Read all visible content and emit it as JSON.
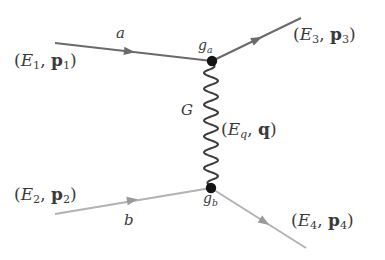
{
  "figure": {
    "kind": "feynman-diagram",
    "title": "",
    "background_color": "#ffffff",
    "width": 385,
    "height": 260
  },
  "colors": {
    "upper_fermion_line": "#6a6a6a",
    "lower_fermion_line": "#b2b2b2",
    "propagator": "#3c3c3c",
    "vertex_dot": "#141414",
    "label_text": "#3a3a3a"
  },
  "labels": {
    "p1": {
      "open": "(",
      "E": "E",
      "E_sub": "1",
      "comma": ", ",
      "p": "p",
      "p_sub": "1",
      "close": ")"
    },
    "p2": {
      "open": "(",
      "E": "E",
      "E_sub": "2",
      "comma": ", ",
      "p": "p",
      "p_sub": "2",
      "close": ")"
    },
    "p3": {
      "open": "(",
      "E": "E",
      "E_sub": "3",
      "comma": ", ",
      "p": "p",
      "p_sub": "3",
      "close": ")"
    },
    "p4": {
      "open": "(",
      "E": "E",
      "E_sub": "4",
      "comma": ", ",
      "p": "p",
      "p_sub": "4",
      "close": ")"
    },
    "q": {
      "open": "(",
      "E": "E",
      "E_sub": "q",
      "comma": ", ",
      "p": "q",
      "close": ")"
    },
    "particle_a": "a",
    "particle_b": "b",
    "boson": "G",
    "vertex_a": {
      "g": "g",
      "sub": "a"
    },
    "vertex_b": {
      "g": "g",
      "sub": "b"
    }
  },
  "geometry": {
    "vertex_a": {
      "x": 212,
      "y": 61
    },
    "vertex_b": {
      "x": 211,
      "y": 188
    },
    "vertex_radius": 5,
    "incoming_a": {
      "x1": 55,
      "y1": 43,
      "x2": 212,
      "y2": 61,
      "arrow_t": 0.48
    },
    "outgoing_3": {
      "x1": 212,
      "y1": 61,
      "x2": 301,
      "y2": 18,
      "arrow_t": 0.52
    },
    "incoming_b": {
      "x1": 55,
      "y1": 214,
      "x2": 211,
      "y2": 188,
      "arrow_t": 0.5
    },
    "outgoing_4": {
      "x1": 211,
      "y1": 188,
      "x2": 306,
      "y2": 248,
      "arrow_t": 0.52
    },
    "propagator": {
      "x": 211,
      "y1": 61,
      "y2": 188,
      "amplitude": 7,
      "cycles": 8
    }
  }
}
